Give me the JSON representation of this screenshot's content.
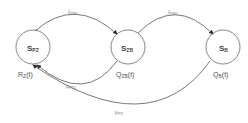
{
  "diagram": {
    "type": "state-transition",
    "states": [
      {
        "id": "S_PZ",
        "main": "S",
        "sub": "PZ",
        "output_main": "R",
        "output_sub": "Z",
        "output_arg": "(t)"
      },
      {
        "id": "S_ZB",
        "main": "S",
        "sub": "ZB",
        "output_main": "Q",
        "output_sub": "ZB",
        "output_arg": "(t)"
      },
      {
        "id": "S_B",
        "main": "S",
        "sub": "B",
        "output_main": "Q",
        "output_sub": "B",
        "output_arg": "(t)"
      }
    ],
    "transitions": [
      {
        "from": "S_PZ",
        "to": "S_ZB",
        "main": "λ",
        "sub": "ZB1"
      },
      {
        "from": "S_ZB",
        "to": "S_B",
        "main": "λ",
        "sub": "ZB2"
      },
      {
        "from": "S_ZB",
        "to": "S_PZ",
        "main": "μ",
        "sub": "PZ1"
      },
      {
        "from": "S_B",
        "to": "S_PZ",
        "main": "μ",
        "sub": "PZ"
      }
    ]
  }
}
